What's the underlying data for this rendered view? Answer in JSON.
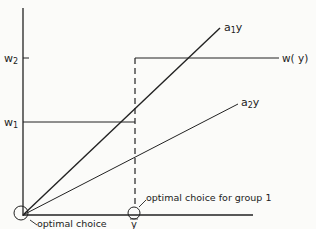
{
  "diagram": {
    "axis_labels": {
      "w2": "w",
      "w2_sub": "2",
      "w1": "w",
      "w1_sub": "1",
      "ybar": "y"
    },
    "curves": {
      "a1y": {
        "label": "a",
        "sub": "1",
        "suffix": "y"
      },
      "a2y": {
        "label": "a",
        "sub": "2",
        "suffix": "y"
      },
      "wy": {
        "label": "w( y)"
      }
    },
    "annotations": {
      "origin_line1": "optimal choice",
      "origin_line2": "for group 1.",
      "ybar_note": "optimal choice for group 1"
    },
    "colors": {
      "ink": "#222222",
      "background": "#fbfbf9"
    }
  }
}
